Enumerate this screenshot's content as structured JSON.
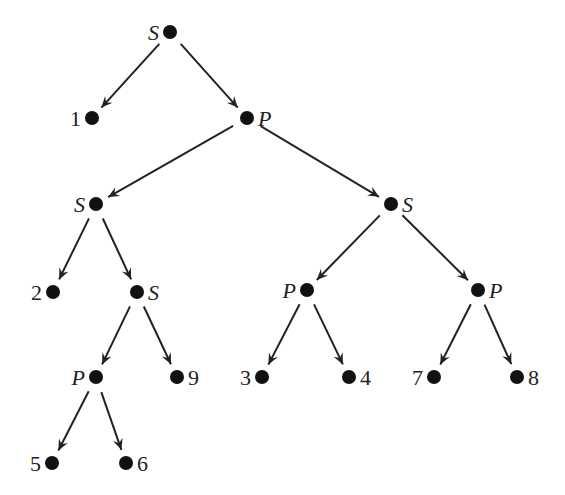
{
  "diagram": {
    "type": "tree",
    "colors": {
      "node": "#111111",
      "edge": "#222222",
      "background": "#ffffff"
    },
    "nodes": [
      {
        "id": "n0",
        "label": "S",
        "kind": "internal",
        "x": 170,
        "y": 32,
        "side": "left"
      },
      {
        "id": "n1",
        "label": "1",
        "kind": "leaf",
        "x": 92,
        "y": 118,
        "side": "left"
      },
      {
        "id": "n2",
        "label": "P",
        "kind": "internal",
        "x": 247,
        "y": 118,
        "side": "right"
      },
      {
        "id": "n3",
        "label": "S",
        "kind": "internal",
        "x": 96,
        "y": 204,
        "side": "left"
      },
      {
        "id": "n4",
        "label": "S",
        "kind": "internal",
        "x": 391,
        "y": 204,
        "side": "right"
      },
      {
        "id": "n5",
        "label": "2",
        "kind": "leaf",
        "x": 53,
        "y": 292,
        "side": "left"
      },
      {
        "id": "n6",
        "label": "S",
        "kind": "internal",
        "x": 137,
        "y": 292,
        "side": "right"
      },
      {
        "id": "n7",
        "label": "P",
        "kind": "internal",
        "x": 307,
        "y": 290,
        "side": "left"
      },
      {
        "id": "n8",
        "label": "P",
        "kind": "internal",
        "x": 478,
        "y": 290,
        "side": "right"
      },
      {
        "id": "n9",
        "label": "P",
        "kind": "internal",
        "x": 96,
        "y": 377,
        "side": "left"
      },
      {
        "id": "n10",
        "label": "9",
        "kind": "leaf",
        "x": 177,
        "y": 377,
        "side": "right"
      },
      {
        "id": "n11",
        "label": "3",
        "kind": "leaf",
        "x": 262,
        "y": 377,
        "side": "left"
      },
      {
        "id": "n12",
        "label": "4",
        "kind": "leaf",
        "x": 349,
        "y": 377,
        "side": "right"
      },
      {
        "id": "n13",
        "label": "7",
        "kind": "leaf",
        "x": 434,
        "y": 377,
        "side": "left"
      },
      {
        "id": "n14",
        "label": "8",
        "kind": "leaf",
        "x": 517,
        "y": 377,
        "side": "right"
      },
      {
        "id": "n15",
        "label": "5",
        "kind": "leaf",
        "x": 52,
        "y": 463,
        "side": "left"
      },
      {
        "id": "n16",
        "label": "6",
        "kind": "leaf",
        "x": 126,
        "y": 463,
        "side": "right"
      }
    ],
    "edges": [
      [
        "n0",
        "n1"
      ],
      [
        "n0",
        "n2"
      ],
      [
        "n2",
        "n3"
      ],
      [
        "n2",
        "n4"
      ],
      [
        "n3",
        "n5"
      ],
      [
        "n3",
        "n6"
      ],
      [
        "n4",
        "n7"
      ],
      [
        "n4",
        "n8"
      ],
      [
        "n6",
        "n9"
      ],
      [
        "n6",
        "n10"
      ],
      [
        "n7",
        "n11"
      ],
      [
        "n7",
        "n12"
      ],
      [
        "n8",
        "n13"
      ],
      [
        "n8",
        "n14"
      ],
      [
        "n9",
        "n15"
      ],
      [
        "n9",
        "n16"
      ]
    ]
  }
}
